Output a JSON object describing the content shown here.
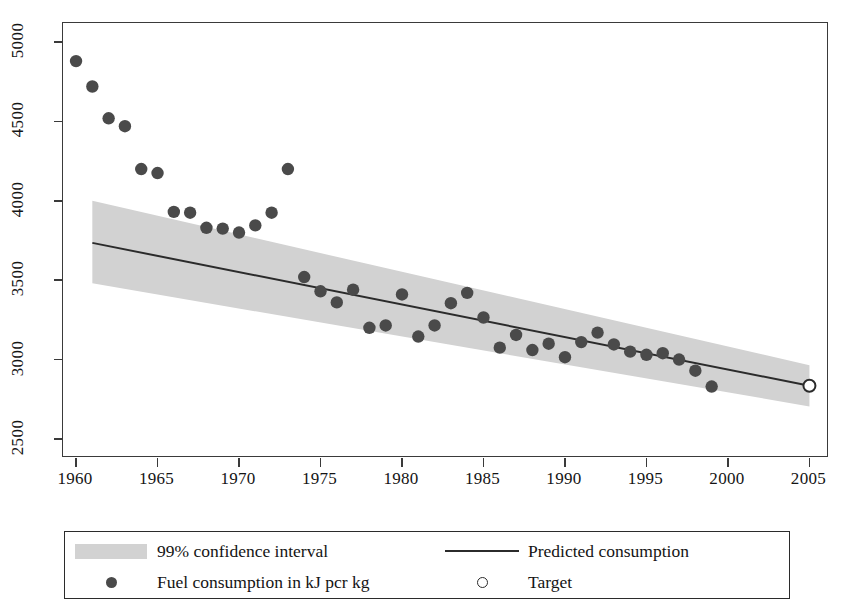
{
  "chart_data": {
    "type": "scatter",
    "title": "",
    "xlabel": "",
    "ylabel": "",
    "xlim": [
      1959.2,
      2006.2
    ],
    "ylim": [
      2380,
      5120
    ],
    "xticks": [
      1960,
      1965,
      1970,
      1975,
      1980,
      1985,
      1990,
      1995,
      2000,
      2005
    ],
    "yticks": [
      2500,
      3000,
      3500,
      4000,
      4500,
      5000
    ],
    "grid": false,
    "legend_position": "below-plot",
    "series": [
      {
        "name": "Fuel consumption in kJ per kg",
        "type": "scatter",
        "marker": "filled-circle",
        "color": "#4a4a4a",
        "x": [
          1960,
          1961,
          1962,
          1963,
          1964,
          1965,
          1966,
          1967,
          1968,
          1969,
          1970,
          1971,
          1972,
          1973,
          1974,
          1975,
          1976,
          1977,
          1978,
          1979,
          1980,
          1981,
          1982,
          1983,
          1984,
          1985,
          1986,
          1987,
          1988,
          1989,
          1990,
          1991,
          1992,
          1993,
          1994,
          1995,
          1996,
          1997,
          1998,
          1999,
          2000
        ],
        "y": [
          4880,
          4720,
          4520,
          4470,
          4200,
          4175,
          3930,
          3925,
          3830,
          3825,
          3800,
          3845,
          3925,
          4200,
          3520,
          3430,
          3360,
          3440,
          3200,
          3215,
          3410,
          3145,
          3215,
          3355,
          3420,
          3265,
          3075,
          3155,
          3060,
          3100,
          3015,
          3110,
          3170,
          3095,
          3050,
          3030,
          3040,
          3000,
          2930,
          2830,
          null
        ]
      },
      {
        "name": "Predicted consumption",
        "type": "line",
        "color": "#2b2b2b",
        "x": [
          1961,
          2005
        ],
        "y": [
          3735,
          2835
        ]
      },
      {
        "name": "99% confidence interval",
        "type": "band",
        "color": "#d2d2d2",
        "x": [
          1961,
          2005
        ],
        "upper": [
          4000,
          2965
        ],
        "lower": [
          3480,
          2705
        ]
      },
      {
        "name": "Target",
        "type": "point",
        "marker": "open-circle",
        "color": "#2b2b2b",
        "x": [
          2005
        ],
        "y": [
          2835
        ]
      }
    ]
  },
  "legend": {
    "items": [
      {
        "key": "band",
        "label": "99% confidence interval"
      },
      {
        "key": "line",
        "label": "Predicted consumption"
      },
      {
        "key": "filled-dot",
        "label": "Fuel consumption in kJ pcr kg"
      },
      {
        "key": "open-dot",
        "label": "Target"
      }
    ]
  },
  "axes": {
    "x_tick_labels": [
      "1960",
      "1965",
      "1970",
      "1975",
      "1980",
      "1985",
      "1990",
      "1995",
      "2000",
      "2005"
    ],
    "y_tick_labels": [
      "2500",
      "3000",
      "3500",
      "4000",
      "4500",
      "5000"
    ]
  },
  "colors": {
    "marker": "#4a4a4a",
    "line": "#2b2b2b",
    "band": "#d2d2d2",
    "axis": "#3a3a3a",
    "background": "#ffffff"
  }
}
